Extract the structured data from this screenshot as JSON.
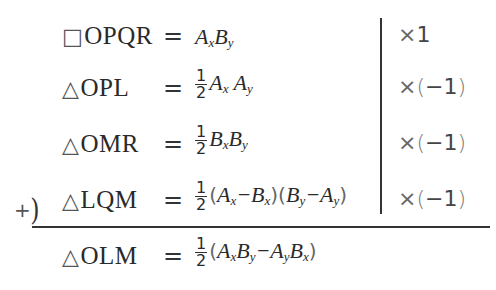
{
  "rows": [
    {
      "shape_symbol": "□",
      "shape_name": "OPQR",
      "equals": "=",
      "rhs": {
        "has_fraction": false,
        "text": "AxBy"
      },
      "multiplier": "×1"
    },
    {
      "shape_symbol": "△",
      "shape_name": "OPL",
      "equals": "=",
      "rhs": {
        "has_fraction": true,
        "numerator": "1",
        "denominator": "2",
        "text": "AxAy"
      },
      "multiplier": "×(−1)"
    },
    {
      "shape_symbol": "△",
      "shape_name": "OMR",
      "equals": "=",
      "rhs": {
        "has_fraction": true,
        "numerator": "1",
        "denominator": "2",
        "text": "BxBy"
      },
      "multiplier": "×(−1)"
    },
    {
      "shape_symbol": "△",
      "shape_name": "LQM",
      "equals": "=",
      "rhs": {
        "has_fraction": true,
        "numerator": "1",
        "denominator": "2",
        "text": "(Ax−Bx)(By−Ay)"
      },
      "multiplier": "×(−1)"
    }
  ],
  "sum_marker": "+",
  "result": {
    "shape_symbol": "△",
    "shape_name": "OLM",
    "equals": "=",
    "rhs": {
      "has_fraction": true,
      "numerator": "1",
      "denominator": "2",
      "text": "(AxBy−AyBx)"
    }
  },
  "mult_parts": {
    "times": "×",
    "one": "1",
    "neg_one_open": "(",
    "neg_one_val": "−1",
    "neg_one_close": ")"
  }
}
